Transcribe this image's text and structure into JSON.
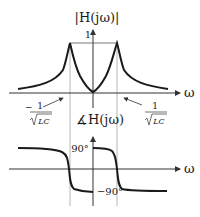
{
  "magnitude_plot": {
    "title": "|H(jω)|",
    "y_tick": "1",
    "x_axis_label": "ω",
    "left_marker": {
      "sign": "−",
      "numerator": "1",
      "denominator": "LC"
    },
    "right_marker": {
      "numerator": "1",
      "denominator": "LC"
    }
  },
  "phase_plot": {
    "title": "∡H(jω)",
    "upper_tick": "90°",
    "lower_tick": "−90°",
    "x_axis_label": "ω"
  },
  "colors": {
    "curve": "#1a1a1a",
    "axis": "#333333",
    "guide": "#999999"
  }
}
